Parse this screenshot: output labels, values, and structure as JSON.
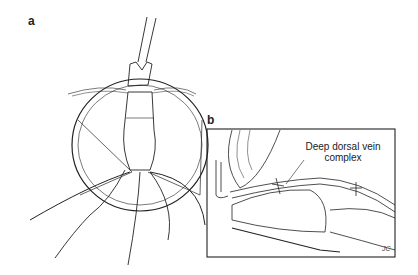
{
  "panels": [
    {
      "id": "a",
      "label": "a",
      "description": "Surgical retraction view with forceps, dissected vessel bundle, drapes"
    },
    {
      "id": "b",
      "label": "b",
      "description": "Sagittal cross-section with ligatures",
      "annotation_line1": "Deep dorsal vein",
      "annotation_line2": "complex",
      "signature": "JC"
    }
  ],
  "colors": {
    "ink": "#222222",
    "background": "#ffffff"
  }
}
